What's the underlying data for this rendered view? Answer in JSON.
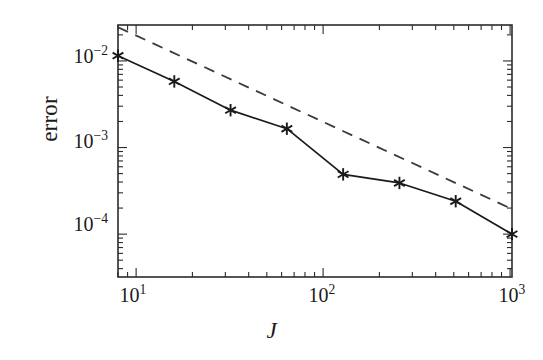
{
  "figure": {
    "background_color": "#ffffff",
    "line_color": "#1a1a1a",
    "axis_color": "#2b2b2b"
  },
  "axes": {
    "y_label": "error",
    "x_label": "J",
    "x_tick_labels": [
      {
        "mantissa": "10",
        "exponent": "1",
        "value": 10
      },
      {
        "mantissa": "10",
        "exponent": "2",
        "value": 100
      },
      {
        "mantissa": "10",
        "exponent": "3",
        "value": 1000
      }
    ],
    "y_tick_labels": [
      {
        "mantissa": "10",
        "exponent": "−2",
        "value": 0.01
      },
      {
        "mantissa": "10",
        "exponent": "−3",
        "value": 0.001
      },
      {
        "mantissa": "10",
        "exponent": "−4",
        "value": 0.0001
      }
    ]
  },
  "chart_data": {
    "type": "line",
    "title": "",
    "xlabel": "J",
    "ylabel": "error",
    "xscale": "log",
    "yscale": "log",
    "xlim": [
      8,
      1024
    ],
    "ylim": [
      3.2e-05,
      0.026
    ],
    "grid": false,
    "legend": null,
    "series": [
      {
        "name": "error",
        "style": "solid",
        "marker": "asterisk",
        "color": "#1a1a1a",
        "x": [
          8,
          16,
          32,
          64,
          128,
          256,
          512,
          1024
        ],
        "y": [
          0.0115,
          0.0058,
          0.0027,
          0.00165,
          0.00049,
          0.00039,
          0.00024,
          0.0001
        ]
      },
      {
        "name": "reference-slope",
        "style": "dashed",
        "marker": "none",
        "color": "#3a3a3a",
        "x": [
          8,
          1024
        ],
        "y": [
          0.0245,
          0.000195
        ]
      }
    ]
  }
}
